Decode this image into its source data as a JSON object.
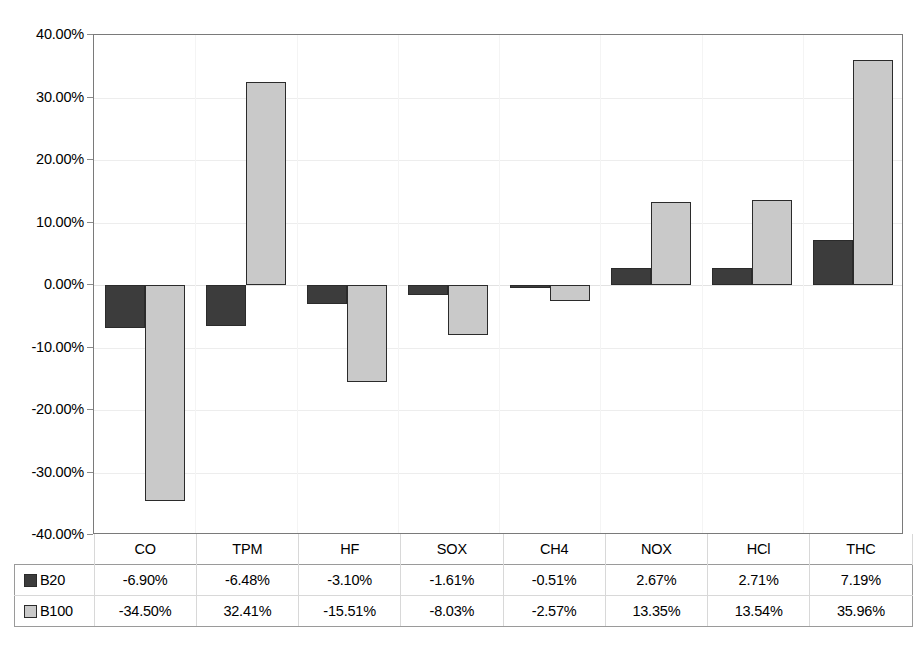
{
  "chart_data": {
    "type": "bar",
    "title": "",
    "subtitle": "",
    "xlabel": "",
    "ylabel": "",
    "categories": [
      "CO",
      "TPM",
      "HF",
      "SOX",
      "CH4",
      "NOX",
      "HCl",
      "THC"
    ],
    "series": [
      {
        "name": "B20",
        "color": "#3c3c3c",
        "values": [
          -6.9,
          -6.48,
          -3.1,
          -1.61,
          -0.51,
          2.67,
          2.71,
          7.19
        ],
        "labels": [
          "-6.90%",
          "-6.48%",
          "-3.10%",
          "-1.61%",
          "-0.51%",
          "2.67%",
          "2.71%",
          "7.19%"
        ]
      },
      {
        "name": "B100",
        "color": "#c9c9c9",
        "values": [
          -34.5,
          32.41,
          -15.51,
          -8.03,
          -2.57,
          13.35,
          13.54,
          35.96
        ],
        "labels": [
          "-34.50%",
          "32.41%",
          "-15.51%",
          "-8.03%",
          "-2.57%",
          "13.35%",
          "13.54%",
          "35.96%"
        ]
      }
    ],
    "ylim": [
      -40,
      40
    ],
    "ytick_values": [
      40,
      30,
      20,
      10,
      0,
      -10,
      -20,
      -30,
      -40
    ],
    "ytick_labels": [
      "40.00%",
      "30.00%",
      "20.00%",
      "10.00%",
      "0.00%",
      "-10.00%",
      "-20.00%",
      "-30.00%",
      "-40.00%"
    ],
    "grid": true,
    "legend_position": "data-table",
    "value_unit": "percent"
  },
  "table": {
    "category_header_blank": "",
    "row_labels": [
      "B20",
      "B100"
    ]
  },
  "colors": {
    "series_b20": "#3c3c3c",
    "series_b100": "#c9c9c9",
    "bar_outline": "#2b2b2b",
    "plot_border": "#7a7a7a",
    "gridline": "#ededed",
    "table_border": "#d8d8d8",
    "background": "#ffffff"
  }
}
